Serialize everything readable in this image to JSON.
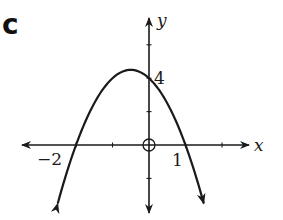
{
  "panel_label": "c",
  "axes": {
    "x_label": "x",
    "y_label": "y",
    "origin_px": [
      149,
      145
    ],
    "x_scale_px_per_unit": 36.5,
    "y_scale_px_per_unit": 16.7,
    "x_range": [
      -3.5,
      2.75
    ],
    "y_range": [
      -4,
      7.5
    ],
    "x_ticks": [
      -2,
      -1,
      1,
      2
    ],
    "y_ticks": [
      -2,
      2,
      4,
      6
    ],
    "origin_marker": "open-circle"
  },
  "annotations": {
    "x_intercept_left": "−2",
    "x_intercept_right": "1",
    "y_intercept": "4"
  },
  "curve": {
    "type": "parabola",
    "equation": "y = -2(x+2)(x-1)",
    "coefficients": {
      "a": -2,
      "b": -2,
      "c": 4
    },
    "x_intercepts": [
      -2,
      1
    ],
    "y_intercept": 4,
    "vertex": [
      -0.5,
      4.5
    ],
    "x_start": -2.5,
    "x_end": 1.5,
    "ends_with_arrows": true
  },
  "colors": {
    "ink": "#1a1a1a",
    "background": "#ffffff"
  }
}
